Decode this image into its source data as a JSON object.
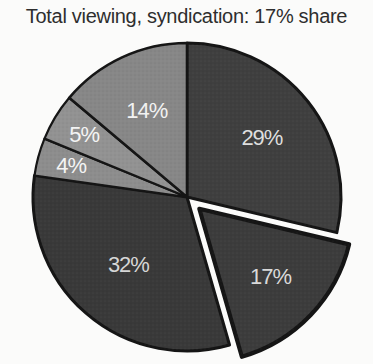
{
  "page": {
    "background": "#fbfbfa"
  },
  "chart_data": {
    "type": "pie",
    "title": "Total viewing, syndication: 17% share",
    "title_color": "#2e2e2e",
    "direction": "clockwise",
    "start_angle_deg": 0,
    "explode_offset_px": 17,
    "stroke_color": "#151515",
    "legend": "none",
    "slices": [
      {
        "label": "29%",
        "value": 29,
        "color": "#3f3f3f",
        "text_color": "#dedede",
        "exploded": false,
        "label_r": 0.62,
        "stroke_w": 3
      },
      {
        "label": "17%",
        "value": 17,
        "color": "#3c3c3c",
        "text_color": "#d9d9d9",
        "exploded": true,
        "label_r": 0.64,
        "stroke_w": 4.2
      },
      {
        "label": "32%",
        "value": 32,
        "color": "#393939",
        "text_color": "#d6d6d6",
        "exploded": false,
        "label_r": 0.58,
        "stroke_w": 3
      },
      {
        "label": "4%",
        "value": 4,
        "color": "#8d8d8d",
        "text_color": "#f4f4f4",
        "exploded": false,
        "label_r": 0.78,
        "stroke_w": 2.2
      },
      {
        "label": "5%",
        "value": 5,
        "color": "#929292",
        "text_color": "#f4f4f4",
        "exploded": false,
        "label_r": 0.78,
        "stroke_w": 2.2
      },
      {
        "label": "14%",
        "value": 14,
        "color": "#878787",
        "text_color": "#f2f2f2",
        "exploded": false,
        "label_r": 0.62,
        "stroke_w": 2.6
      }
    ]
  }
}
